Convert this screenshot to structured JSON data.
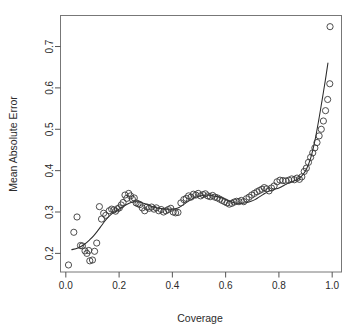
{
  "figure": {
    "name": "mean-absolute-error-vs-coverage-scatter",
    "background_color": "#ffffff",
    "point_color": "#3a3a3a",
    "curve_color": "#2a2a2a",
    "axis_color": "#555555"
  },
  "chart_data": {
    "type": "scatter",
    "title": "",
    "xlabel": "Coverage",
    "ylabel": "Mean Absolute Error",
    "xlim": [
      -0.02,
      1.035
    ],
    "ylim": [
      0.155,
      0.775
    ],
    "xticks": [
      0.0,
      0.2,
      0.4,
      0.6,
      0.8,
      1.0
    ],
    "xtick_labels": [
      "0.0",
      "0.2",
      "0.4",
      "0.6",
      "0.8",
      "1.0"
    ],
    "yticks": [
      0.2,
      0.3,
      0.4,
      0.5,
      0.6,
      0.7
    ],
    "ytick_labels": [
      "0.2",
      "0.3",
      "0.4",
      "0.5",
      "0.6",
      "0.7"
    ],
    "grid": false,
    "legend": false,
    "marker": "open-circle",
    "marker_size": 3.1,
    "series": [
      {
        "name": "observations",
        "x": [
          0.01,
          0.03,
          0.042,
          0.055,
          0.062,
          0.072,
          0.079,
          0.086,
          0.09,
          0.1,
          0.108,
          0.116,
          0.126,
          0.134,
          0.142,
          0.15,
          0.163,
          0.172,
          0.18,
          0.187,
          0.194,
          0.201,
          0.208,
          0.215,
          0.222,
          0.229,
          0.236,
          0.243,
          0.25,
          0.257,
          0.264,
          0.271,
          0.278,
          0.287,
          0.296,
          0.305,
          0.313,
          0.322,
          0.331,
          0.34,
          0.349,
          0.358,
          0.367,
          0.376,
          0.385,
          0.394,
          0.403,
          0.412,
          0.421,
          0.432,
          0.443,
          0.452,
          0.461,
          0.47,
          0.479,
          0.488,
          0.497,
          0.506,
          0.515,
          0.524,
          0.533,
          0.542,
          0.551,
          0.56,
          0.569,
          0.578,
          0.587,
          0.596,
          0.605,
          0.614,
          0.623,
          0.632,
          0.641,
          0.65,
          0.659,
          0.668,
          0.678,
          0.688,
          0.698,
          0.708,
          0.718,
          0.727,
          0.736,
          0.745,
          0.754,
          0.763,
          0.772,
          0.782,
          0.793,
          0.804,
          0.815,
          0.826,
          0.837,
          0.848,
          0.858,
          0.868,
          0.877,
          0.886,
          0.895,
          0.903,
          0.911,
          0.919,
          0.927,
          0.935,
          0.943,
          0.951,
          0.959,
          0.967,
          0.975,
          0.983,
          0.991
        ],
        "y": [
          0.172,
          0.251,
          0.288,
          0.219,
          0.218,
          0.206,
          0.2,
          0.207,
          0.182,
          0.184,
          0.205,
          0.225,
          0.313,
          0.283,
          0.297,
          0.292,
          0.303,
          0.307,
          0.305,
          0.302,
          0.308,
          0.31,
          0.317,
          0.323,
          0.341,
          0.333,
          0.345,
          0.339,
          0.331,
          0.334,
          0.322,
          0.32,
          0.318,
          0.31,
          0.303,
          0.312,
          0.309,
          0.312,
          0.307,
          0.31,
          0.303,
          0.306,
          0.3,
          0.303,
          0.306,
          0.309,
          0.3,
          0.298,
          0.299,
          0.322,
          0.33,
          0.333,
          0.339,
          0.336,
          0.343,
          0.341,
          0.345,
          0.339,
          0.342,
          0.344,
          0.339,
          0.337,
          0.34,
          0.336,
          0.334,
          0.331,
          0.328,
          0.325,
          0.322,
          0.319,
          0.321,
          0.324,
          0.326,
          0.325,
          0.328,
          0.325,
          0.332,
          0.336,
          0.341,
          0.345,
          0.349,
          0.352,
          0.355,
          0.359,
          0.356,
          0.351,
          0.358,
          0.363,
          0.373,
          0.377,
          0.376,
          0.375,
          0.377,
          0.38,
          0.378,
          0.382,
          0.379,
          0.385,
          0.398,
          0.406,
          0.42,
          0.432,
          0.443,
          0.455,
          0.468,
          0.484,
          0.5,
          0.52,
          0.545,
          0.572,
          0.61
        ]
      },
      {
        "name": "outlier",
        "x": [
          0.992
        ],
        "y": [
          0.748
        ]
      }
    ],
    "smooth_curve": {
      "name": "loess-fit",
      "x": [
        0.022,
        0.045,
        0.068,
        0.09,
        0.105,
        0.12,
        0.135,
        0.15,
        0.165,
        0.18,
        0.195,
        0.21,
        0.225,
        0.24,
        0.252,
        0.265,
        0.278,
        0.292,
        0.305,
        0.32,
        0.335,
        0.35,
        0.365,
        0.38,
        0.395,
        0.41,
        0.425,
        0.44,
        0.455,
        0.47,
        0.485,
        0.5,
        0.515,
        0.53,
        0.545,
        0.56,
        0.575,
        0.59,
        0.605,
        0.62,
        0.635,
        0.65,
        0.665,
        0.68,
        0.695,
        0.71,
        0.725,
        0.74,
        0.755,
        0.77,
        0.785,
        0.8,
        0.815,
        0.83,
        0.845,
        0.86,
        0.875,
        0.89,
        0.905,
        0.92,
        0.935,
        0.95,
        0.962,
        0.974,
        0.984
      ],
      "y": [
        0.209,
        0.213,
        0.221,
        0.233,
        0.243,
        0.255,
        0.268,
        0.281,
        0.291,
        0.299,
        0.305,
        0.311,
        0.317,
        0.322,
        0.324,
        0.325,
        0.324,
        0.321,
        0.318,
        0.314,
        0.311,
        0.309,
        0.308,
        0.307,
        0.307,
        0.308,
        0.311,
        0.317,
        0.324,
        0.33,
        0.335,
        0.338,
        0.34,
        0.341,
        0.34,
        0.338,
        0.336,
        0.333,
        0.329,
        0.325,
        0.322,
        0.321,
        0.321,
        0.323,
        0.326,
        0.33,
        0.336,
        0.342,
        0.348,
        0.352,
        0.355,
        0.358,
        0.363,
        0.368,
        0.372,
        0.376,
        0.381,
        0.39,
        0.406,
        0.432,
        0.472,
        0.524,
        0.57,
        0.617,
        0.66
      ]
    }
  }
}
